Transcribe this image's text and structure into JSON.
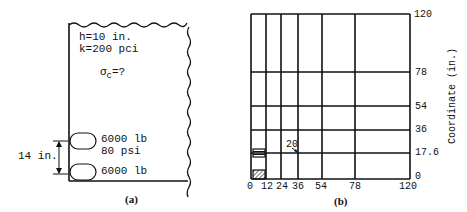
{
  "panel_a": {
    "caption": "(a)",
    "slab_thickness": "h=10 in.",
    "subgrade_modulus": "k=200 pci",
    "stress_symbol": "σ",
    "stress_subscript": "c",
    "stress_query": "=?",
    "wheel_upper_load": "6000 lb",
    "tire_pressure": "80 psi",
    "wheel_lower_load": "6000 lb",
    "axle_spacing": "14 in."
  },
  "panel_b": {
    "caption": "(b)",
    "axis_label": "Coordinate (in.)",
    "x_ticks": [
      "0",
      "12",
      "24",
      "36",
      "54",
      "78",
      "120"
    ],
    "y_ticks": [
      "120",
      "78",
      "54",
      "36",
      "17.6",
      "0"
    ],
    "corner_label": "0",
    "node_annotation": "20"
  }
}
